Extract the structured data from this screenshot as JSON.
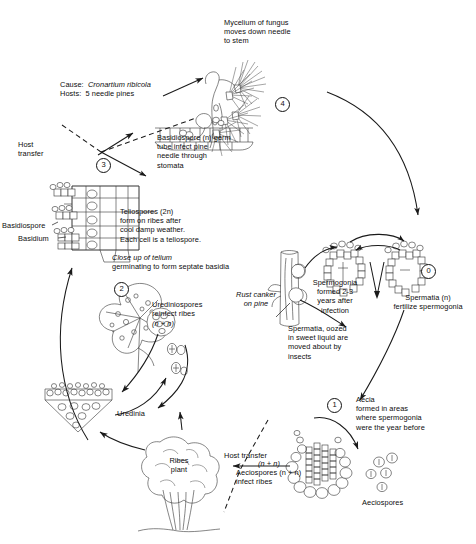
{
  "diagram": {
    "type": "life-cycle-diagram",
    "background_color": "#ffffff",
    "ink_color": "#111111"
  },
  "cause_block": {
    "cause_label": "Cause:",
    "cause_value": "Cronartium ribicola",
    "hosts_label": "Hosts:",
    "hosts_value": "5 needle pines"
  },
  "labels": {
    "mycelium": "Mycelium of fungus\nmoves down needle\nto stem",
    "basidiospore": "Basidiospore (n) germ\ntube infect pine\nneedle through\nstomata",
    "host_transfer_top": "Host\ntransfer",
    "teliospores": "Teliospores (2n)\nform on ribes after\ncool damp weather.\nEach cell is a teliospore.",
    "basidiospore_pointer": "Basidiospore",
    "basidium_pointer": "Basidium",
    "closeup": "Close up of telium",
    "closeup_line2": "germinating to form septate basidia",
    "urediniospores": "Urediniospores\nreinfect ribes",
    "urediniospores_ploidy": "(n + n)",
    "uredinia": "Uredinia",
    "ribes_plant": "Ribes\nplant",
    "host_transfer_bottom": "Host transfer",
    "aeciospores_infect": "Aeciospores (n + n)\ninfect ribes",
    "rust_canker": "Rust canker\non pine",
    "spermogonia": "Spermogonia\nformed 2-3\nyears after\ninfection",
    "spermatia_fertilize": "Spermatia (n)\nfertilize spermogonia",
    "spermatia_oozed": "Spermatia, oozed\nin sweet liquid are\nmoved about by\ninsects",
    "aecia": "Aecia\nformed in areas\nwhere spermogonia\nwere the year before",
    "aeciospores": "Aeciospores",
    "aecia_ploidy": "(n + n)",
    "plus_sign": "+",
    "minus_sign": "-"
  },
  "steps": [
    {
      "id": "step-0",
      "number": "0",
      "stage": "spermogonia-spermatia"
    },
    {
      "id": "step-1",
      "number": "1",
      "stage": "aecia-aeciospores"
    },
    {
      "id": "step-2",
      "number": "2",
      "stage": "urediniospores-on-ribes"
    },
    {
      "id": "step-3",
      "number": "3",
      "stage": "basidiospores-infect-pine"
    },
    {
      "id": "step-4",
      "number": "4",
      "stage": "mycelium-moves-to-stem"
    }
  ]
}
